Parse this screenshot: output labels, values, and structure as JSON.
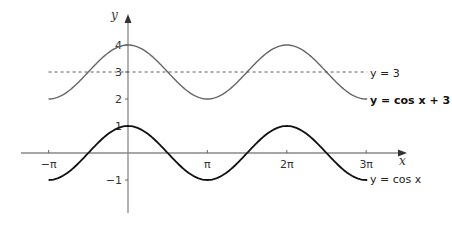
{
  "chart_data": {
    "type": "line",
    "title": "",
    "xlabel": "x",
    "ylabel": "y",
    "xlim": [
      -3.4557,
      4.91
    ],
    "ylim": [
      -2.2,
      4.9
    ],
    "x_ticks": [
      {
        "value": -3.14159,
        "label": "−π"
      },
      {
        "value": 3.14159,
        "label": "π"
      },
      {
        "value": 6.28319,
        "label": "2π"
      },
      {
        "value": 9.42478,
        "label": "3π"
      }
    ],
    "y_ticks": [
      {
        "value": 4,
        "label": "4"
      },
      {
        "value": 3,
        "label": "3"
      },
      {
        "value": 2,
        "label": "2"
      },
      {
        "value": 1,
        "label": "1"
      },
      {
        "value": -1,
        "label": "−1"
      }
    ],
    "series": [
      {
        "name": "y = cos x + 3",
        "function": "cos(x)+3",
        "domain": [
          -3.14159,
          9.42478
        ],
        "style": "solid",
        "color": "#666666",
        "label_bold": true
      },
      {
        "name": "y = 3",
        "function": "3",
        "domain": [
          -3.14159,
          9.42478
        ],
        "style": "dashed",
        "color": "#555555"
      },
      {
        "name": "y = cos x",
        "function": "cos(x)",
        "domain": [
          -3.14159,
          9.42478
        ],
        "style": "solid",
        "color": "#111111"
      }
    ],
    "grid": false,
    "legend": "inline labels at right end of curves"
  },
  "labels": {
    "x_axis": "x",
    "y_axis": "y",
    "upper_curve": "y = cos x + 3",
    "dashed_line": "y = 3",
    "lower_curve": "y = cos x"
  }
}
